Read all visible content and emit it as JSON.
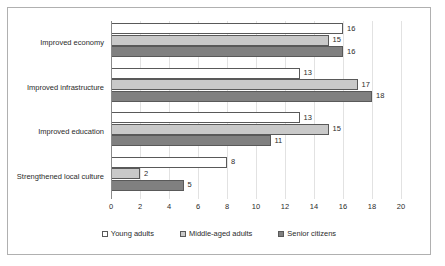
{
  "chart_data": {
    "type": "bar",
    "orientation": "horizontal",
    "title": "",
    "xlabel": "",
    "ylabel": "",
    "xlim": [
      0,
      20
    ],
    "xticks": [
      0,
      2,
      4,
      6,
      8,
      10,
      12,
      14,
      16,
      18,
      20
    ],
    "grid": true,
    "grid_axis": "x",
    "legend_position": "bottom",
    "data_labels": true,
    "categories": [
      "Improved economy",
      "Improved infrastructure",
      "Improved education",
      "Strengthened local culture"
    ],
    "series": [
      {
        "name": "Young adults",
        "color": "#ffffff",
        "border_color": "#595959",
        "values": [
          16,
          13,
          13,
          8
        ]
      },
      {
        "name": "Middle-aged adults",
        "color": "#c9c9c9",
        "border_color": "#595959",
        "values": [
          15,
          17,
          15,
          2
        ]
      },
      {
        "name": "Senior citizens",
        "color": "#808080",
        "border_color": "#595959",
        "values": [
          16,
          18,
          11,
          5
        ]
      }
    ]
  },
  "legend": {
    "items": [
      {
        "label": "Young adults",
        "swatch": "young"
      },
      {
        "label": "Middle-aged adults",
        "swatch": "middle"
      },
      {
        "label": "Senior citizens",
        "swatch": "senior"
      }
    ]
  },
  "colors": {
    "frame_border": "#b0b0b0",
    "gridline": "#e2e2e2",
    "axis": "#8a8a8a",
    "text": "#2b2b2b"
  }
}
